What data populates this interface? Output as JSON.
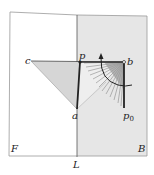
{
  "diagram": {
    "labels": {
      "c": "c",
      "p": "p",
      "b": "b",
      "a": "a",
      "p0": "p",
      "p0_sub": "0",
      "F": "F",
      "L": "L",
      "B": "B"
    },
    "regions": {
      "F": "left half-plane (white)",
      "B": "right half-plane (shaded)"
    },
    "colors": {
      "background": "#ffffff",
      "shaded_plane": "#e6e6e6",
      "triangle_fill": "#dcdcdc",
      "line": "#333333",
      "thick_line": "#222222"
    }
  }
}
